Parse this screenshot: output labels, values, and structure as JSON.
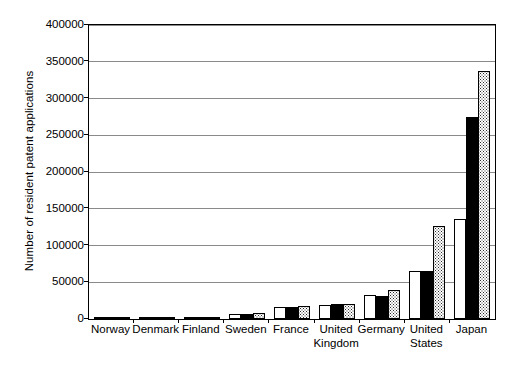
{
  "chart_data": {
    "type": "bar",
    "title": "",
    "subtitle": "",
    "xlabel": "",
    "ylabel": "Number of resident patent applications",
    "ylim": [
      0,
      400000
    ],
    "ytick_step": 50000,
    "yticks": [
      "0",
      "50000",
      "100000",
      "150000",
      "200000",
      "250000",
      "300000",
      "350000",
      "400000"
    ],
    "grid": true,
    "legend": "none",
    "categories": [
      "Norway",
      "Denmark",
      "Finland",
      "Sweden",
      "France",
      "United\nKingdom",
      "Germany",
      "United\nStates",
      "Japan"
    ],
    "series": [
      {
        "name": "series-1",
        "fill": "white",
        "values": [
          1200,
          1400,
          1800,
          6500,
          16500,
          19500,
          32000,
          66000,
          136000
        ]
      },
      {
        "name": "series-2",
        "fill": "black",
        "values": [
          1300,
          1500,
          2600,
          7500,
          17000,
          20500,
          31500,
          65000,
          275000
        ]
      },
      {
        "name": "series-3",
        "fill": "dotted",
        "values": [
          1400,
          1500,
          2400,
          8000,
          17500,
          20000,
          39500,
          126500,
          337000
        ]
      }
    ]
  },
  "colors": {
    "axis": "#000000",
    "gridline": "#8a8a8a",
    "series_white": "#ffffff",
    "series_black": "#000000",
    "series_dotted": "#2b2b2b",
    "background": "#ffffff"
  }
}
